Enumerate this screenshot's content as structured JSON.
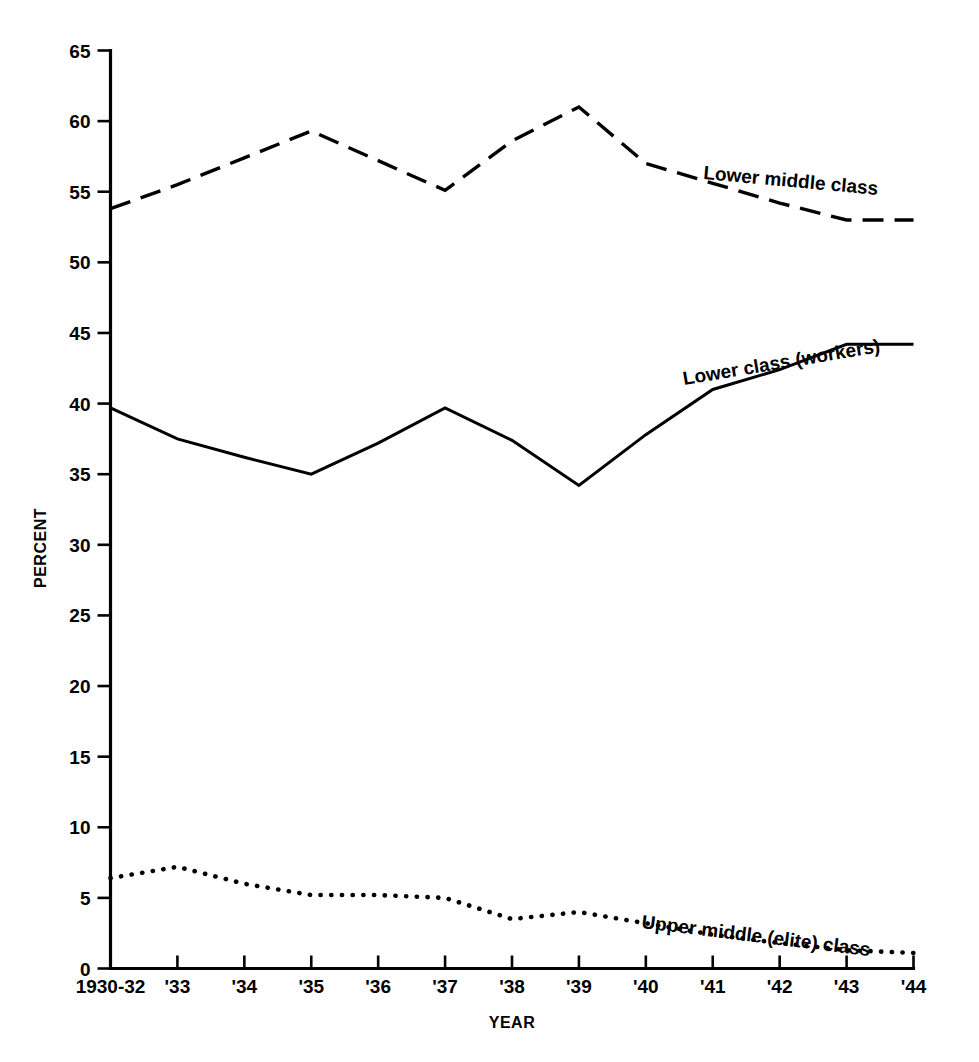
{
  "chart_data": {
    "type": "line",
    "title": "",
    "xlabel": "YEAR",
    "ylabel": "PERCENT",
    "ylim": [
      0,
      65
    ],
    "yticks": [
      0,
      5,
      10,
      15,
      20,
      25,
      30,
      35,
      40,
      45,
      50,
      55,
      60,
      65
    ],
    "ytick_labels": [
      "0",
      "5",
      "10",
      "15",
      "20",
      "25",
      "30",
      "35",
      "40",
      "45",
      "50",
      "55",
      "60",
      "65"
    ],
    "grid": false,
    "legend_position": "inline-annotations",
    "categories": [
      "1930-32",
      "'33",
      "'34",
      "'35",
      "'36",
      "'37",
      "'38",
      "'39",
      "'40",
      "'41",
      "'42",
      "'43",
      "'44"
    ],
    "x": [
      0,
      1,
      2,
      3,
      4,
      5,
      6,
      7,
      8,
      9,
      10,
      11,
      12
    ],
    "series": [
      {
        "name": "Lower middle class",
        "style": "dashed",
        "label": "Lower middle class",
        "values": [
          53.8,
          55.5,
          57.4,
          59.3,
          57.2,
          55.1,
          58.6,
          61.0,
          57.0,
          55.6,
          54.2,
          53.0,
          53.0
        ]
      },
      {
        "name": "Lower class (workers)",
        "style": "solid",
        "label": "Lower class (workers)",
        "values": [
          39.7,
          37.5,
          36.2,
          35.0,
          37.2,
          39.7,
          37.4,
          34.2,
          37.8,
          41.0,
          42.4,
          44.2,
          44.2
        ]
      },
      {
        "name": "Upper middle (elite) class",
        "style": "dotted",
        "label": "Upper middle (elite) class",
        "values": [
          6.4,
          7.2,
          6.0,
          5.2,
          5.2,
          5.0,
          3.5,
          4.0,
          3.2,
          2.4,
          1.8,
          1.3,
          1.1
        ]
      }
    ],
    "colors": {
      "axis": "#000000",
      "series": "#000000",
      "background": "#ffffff"
    }
  },
  "annotations": {
    "lower_middle_class": {
      "text": "Lower middle class",
      "x": 703,
      "y": 179,
      "rotation": 5.2
    },
    "lower_class_workers": {
      "text": "Lower class (workers)",
      "x": 684,
      "y": 385,
      "rotation": -9.5
    },
    "upper_middle_elite_class": {
      "text": "Upper middle (elite) class",
      "x": 641,
      "y": 928,
      "rotation": 7.0
    }
  },
  "axes": {
    "y_title": "PERCENT",
    "x_title": "YEAR"
  }
}
